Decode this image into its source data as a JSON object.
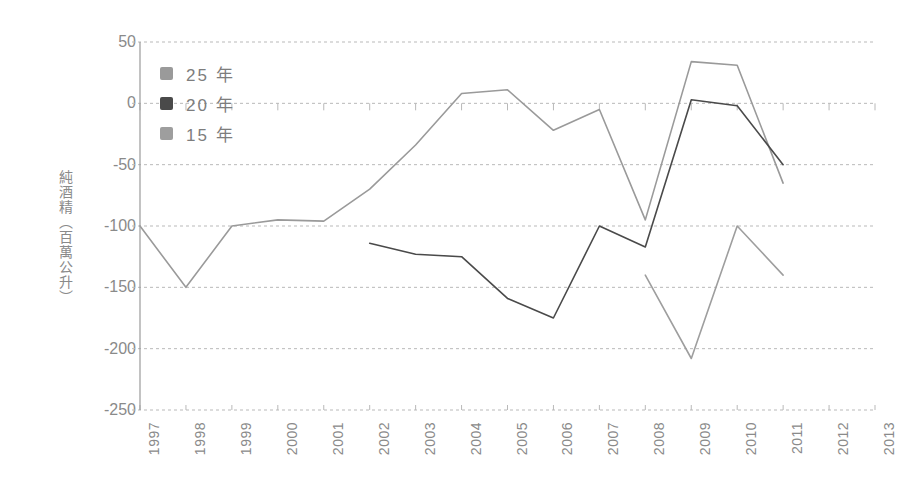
{
  "chart_data": {
    "type": "line",
    "title": "",
    "xlabel": "",
    "ylabel": "純酒精（百萬公升）",
    "categories": [
      "1997",
      "1998",
      "1999",
      "2000",
      "2001",
      "2002",
      "2003",
      "2004",
      "2005",
      "2006",
      "2007",
      "2008",
      "2009",
      "2010",
      "2011",
      "2012",
      "2013"
    ],
    "yticks": [
      "50",
      "0",
      "-50",
      "-100",
      "-150",
      "-200",
      "-250"
    ],
    "ytick_values": [
      50,
      0,
      -50,
      -100,
      -150,
      -200,
      -250
    ],
    "ylim": [
      -250,
      50
    ],
    "grid": true,
    "legend_position": "upper-left",
    "series": [
      {
        "name": "25 年",
        "color": "#9a9a9a",
        "values": [
          -100,
          -150,
          -100,
          -95,
          -96,
          -70,
          -34,
          8,
          11,
          -22,
          -5,
          -95,
          34,
          31,
          -65,
          null,
          null
        ]
      },
      {
        "name": "20 年",
        "color": "#4a4a4a",
        "values": [
          null,
          null,
          null,
          null,
          null,
          -114,
          -123,
          -125,
          -159,
          -175,
          -100,
          -117,
          3,
          -2,
          -50,
          null,
          null
        ]
      },
      {
        "name": "15 年",
        "color": "#9e9e9e",
        "values": [
          null,
          null,
          null,
          null,
          null,
          null,
          null,
          null,
          null,
          null,
          null,
          -140,
          -208,
          -100,
          -140,
          null,
          null
        ]
      }
    ]
  },
  "legend": {
    "items": [
      {
        "label": "25 年",
        "color": "#9a9a9a"
      },
      {
        "label": "20 年",
        "color": "#4a4a4a"
      },
      {
        "label": "15 年",
        "color": "#9e9e9e"
      }
    ]
  },
  "colors": {
    "grid": "#b9b9b9",
    "axis": "#9a9a9a",
    "text": "#8a8a8a",
    "background": "#ffffff"
  }
}
